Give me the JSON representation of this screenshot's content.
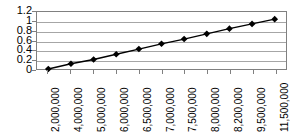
{
  "chart_data": {
    "type": "line",
    "title": "",
    "subtitle": "",
    "xlabel": "",
    "ylabel": "",
    "categories": [
      "2,000,000",
      "4,000,000",
      "5,000,000",
      "6,000,000",
      "6,500,000",
      "7,000,000",
      "7,500,000",
      "8,000,000",
      "8,200,000",
      "9,500,000",
      "11,500,000"
    ],
    "values": [
      0,
      0.11,
      0.2,
      0.31,
      0.42,
      0.53,
      0.63,
      0.74,
      0.85,
      0.95,
      1.05
    ],
    "series": [
      {
        "name": "",
        "values": [
          0,
          0.11,
          0.2,
          0.31,
          0.42,
          0.53,
          0.63,
          0.74,
          0.85,
          0.95,
          1.05
        ]
      }
    ],
    "ylim": [
      0,
      1.2
    ],
    "yticks": [
      0,
      0.2,
      0.4,
      0.6,
      0.8,
      1,
      1.2
    ],
    "ytick_labels": [
      "0",
      "0.2",
      "0.4",
      "0.6",
      "0.8",
      "1",
      "1.2"
    ],
    "grid": true,
    "grid_axis": "y",
    "legend": false,
    "legend_position": "none",
    "marker": "diamond",
    "line_color": "#000000",
    "marker_color": "#000000",
    "grid_color": "#a6a6a6",
    "frame_color": "#808080",
    "background_color": "#ffffff"
  }
}
